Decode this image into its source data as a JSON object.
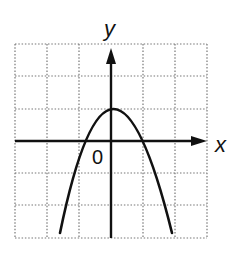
{
  "figure": {
    "type": "function-graph",
    "labels": {
      "x_axis": "x",
      "y_axis": "y",
      "origin": "0"
    },
    "grid": {
      "columns": 6,
      "rows": 6,
      "style": "dotted",
      "x_range": [
        -3,
        3
      ],
      "y_range": [
        -3,
        3
      ]
    },
    "curve": {
      "shape": "downward-opening parabola",
      "vertex": [
        0,
        1
      ],
      "x_intercepts": [
        -0.8,
        1
      ],
      "y_intercept": 1,
      "endpoints": [
        [
          -1.6,
          -2.85
        ],
        [
          1.9,
          -2.85
        ]
      ]
    },
    "colors": {
      "line": "#111111",
      "grid": "#777777",
      "background": "#ffffff"
    }
  }
}
